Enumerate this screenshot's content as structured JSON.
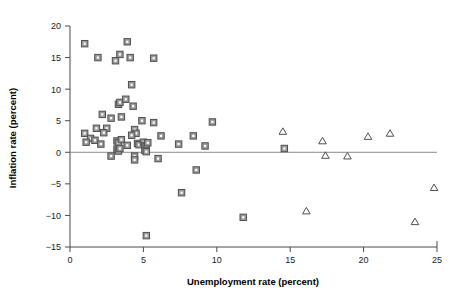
{
  "chart_data": {
    "type": "scatter",
    "title": "",
    "xlabel": "Unemployment rate (percent)",
    "ylabel": "Inflation rate (percent)",
    "xlim": [
      0,
      25
    ],
    "ylim": [
      -15,
      20
    ],
    "xticks": [
      0,
      5,
      10,
      15,
      20,
      25
    ],
    "yticks": [
      -15,
      -10,
      -5,
      0,
      5,
      10,
      15,
      20
    ],
    "xticklabels": [
      "0",
      "5",
      "10",
      "15",
      "20",
      "25"
    ],
    "yticklabels": [
      "-15",
      "-10",
      "-5",
      "0",
      "5",
      "10",
      "15",
      "20"
    ],
    "grid": false,
    "legend": "none",
    "reference_lines": [
      {
        "orientation": "horizontal",
        "value": 0,
        "color": "#8a8a8a"
      }
    ],
    "marker_colors": {
      "square_fill": "#9a9a9a",
      "square_edge": "#4f4f4f",
      "triangle_edge": "#4f4f4f",
      "axis": "#4a4a4a"
    },
    "series": [
      {
        "name": "square-series",
        "marker": "square",
        "points": [
          [
            1.0,
            17.2
          ],
          [
            1.9,
            15.0
          ],
          [
            3.1,
            14.5
          ],
          [
            3.4,
            15.5
          ],
          [
            3.9,
            17.5
          ],
          [
            4.1,
            15.0
          ],
          [
            5.7,
            14.9
          ],
          [
            4.2,
            10.7
          ],
          [
            3.3,
            7.6
          ],
          [
            3.4,
            7.9
          ],
          [
            3.8,
            8.4
          ],
          [
            4.3,
            7.3
          ],
          [
            2.2,
            6.0
          ],
          [
            2.8,
            5.4
          ],
          [
            3.5,
            5.6
          ],
          [
            4.9,
            5.0
          ],
          [
            5.7,
            4.7
          ],
          [
            9.7,
            4.8
          ],
          [
            1.8,
            3.8
          ],
          [
            2.5,
            3.8
          ],
          [
            2.3,
            3.1
          ],
          [
            1.0,
            3.0
          ],
          [
            4.4,
            3.6
          ],
          [
            4.5,
            3.0
          ],
          [
            4.2,
            2.7
          ],
          [
            6.2,
            2.6
          ],
          [
            8.4,
            2.6
          ],
          [
            1.4,
            2.2
          ],
          [
            1.1,
            1.6
          ],
          [
            1.7,
            1.9
          ],
          [
            2.1,
            1.3
          ],
          [
            3.2,
            1.8
          ],
          [
            3.3,
            1.5
          ],
          [
            3.5,
            2.0
          ],
          [
            3.9,
            1.1
          ],
          [
            4.6,
            1.4
          ],
          [
            4.7,
            1.2
          ],
          [
            5.0,
            1.6
          ],
          [
            5.1,
            1.1
          ],
          [
            5.2,
            0.9
          ],
          [
            5.3,
            1.5
          ],
          [
            7.4,
            1.3
          ],
          [
            9.2,
            1.0
          ],
          [
            14.6,
            0.6
          ],
          [
            3.2,
            0.5
          ],
          [
            3.3,
            0.2
          ],
          [
            3.4,
            0.6
          ],
          [
            5.1,
            0.3
          ],
          [
            5.2,
            0.1
          ],
          [
            2.8,
            -0.6
          ],
          [
            4.4,
            -0.6
          ],
          [
            4.4,
            -1.2
          ],
          [
            6.0,
            -1.0
          ],
          [
            8.6,
            -2.8
          ],
          [
            7.6,
            -6.4
          ],
          [
            5.2,
            -13.2
          ],
          [
            11.8,
            -10.3
          ]
        ]
      },
      {
        "name": "triangle-series",
        "marker": "triangle",
        "points": [
          [
            14.5,
            3.3
          ],
          [
            17.2,
            1.8
          ],
          [
            20.3,
            2.5
          ],
          [
            21.8,
            3.0
          ],
          [
            17.4,
            -0.5
          ],
          [
            18.9,
            -0.6
          ],
          [
            24.8,
            -5.6
          ],
          [
            16.1,
            -9.3
          ],
          [
            23.5,
            -11.0
          ]
        ]
      }
    ]
  }
}
